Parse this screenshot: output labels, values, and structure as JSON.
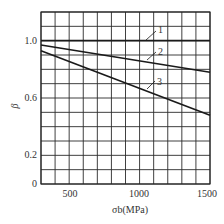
{
  "chart_data": {
    "type": "line",
    "title": "",
    "xlabel": "σb(MPa)",
    "ylabel": "β",
    "xlim": [
      300,
      1500
    ],
    "ylim": [
      0,
      1.2
    ],
    "grid": true,
    "x_ticks": [
      "500",
      "1000",
      "1500"
    ],
    "y_ticks": [
      "0",
      "0.2",
      "0.6",
      "1.0"
    ],
    "x_grid_step": 100,
    "y_grid_step": 0.1,
    "series": [
      {
        "name": "1",
        "x": [
          300,
          1500
        ],
        "values": [
          1.0,
          1.0
        ]
      },
      {
        "name": "2",
        "x": [
          300,
          1500
        ],
        "values": [
          0.97,
          0.78
        ]
      },
      {
        "name": "3",
        "x": [
          300,
          1500
        ],
        "values": [
          0.93,
          0.48
        ]
      }
    ],
    "legend": "inline curve labels 1, 2, 3"
  }
}
